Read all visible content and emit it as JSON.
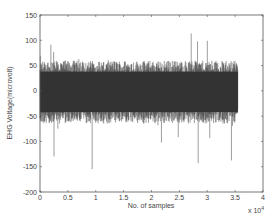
{
  "chart_data": {
    "type": "line",
    "title": "",
    "xlabel": "No. of samples",
    "ylabel": "EHG Voltage(microvolt)",
    "x_multiplier_label": "x 10",
    "x_multiplier_exponent": "4",
    "xlim": [
      0,
      4
    ],
    "ylim": [
      -200,
      150
    ],
    "x_ticks": [
      "0",
      "0.5",
      "1",
      "1.5",
      "2",
      "2.5",
      "3",
      "3.5",
      "4"
    ],
    "y_ticks": [
      "150",
      "100",
      "50",
      "0",
      "-50",
      "-100",
      "-150",
      "-200"
    ],
    "grid": false,
    "legend": null,
    "series": [
      {
        "name": "EHG signal",
        "color": "#3a3a3a",
        "x_range_scaled": [
          0,
          3.55
        ],
        "description": "Dense noisy EHG signal centered near 0 microvolt, bulk envelope roughly -60 to +60, peaks up to ~115, troughs down to ~-165",
        "envelope_upper": 60,
        "envelope_lower": -65,
        "max_peak": 115,
        "min_trough": -165
      }
    ]
  },
  "colors": {
    "signal": "#3a3a3a",
    "axis": "#555555",
    "background": "#ffffff"
  }
}
